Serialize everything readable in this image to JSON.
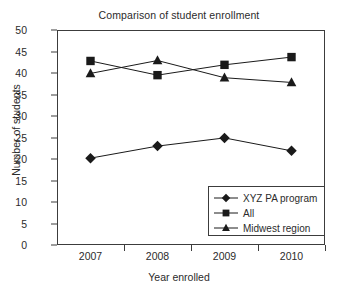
{
  "chart_data": {
    "type": "line",
    "title": "Comparison of student enrollment",
    "xlabel": "Year enrolled",
    "ylabel": "Number of students",
    "categories": [
      "2007",
      "2008",
      "2009",
      "2010"
    ],
    "ylim": [
      0,
      50
    ],
    "ytick_step": 5,
    "yticks": [
      "50",
      "45",
      "40",
      "35",
      "30",
      "25",
      "20",
      "15",
      "10",
      "5",
      "0"
    ],
    "grid": false,
    "legend_position": "inside-bottom-right",
    "series": [
      {
        "name": "XYZ PA program",
        "marker": "diamond",
        "color": "#1a1a1a",
        "values": [
          20.2,
          23.0,
          24.9,
          21.9
        ]
      },
      {
        "name": "All",
        "marker": "square",
        "color": "#1a1a1a",
        "values": [
          42.8,
          39.5,
          41.9,
          43.7
        ]
      },
      {
        "name": "Midwest region",
        "marker": "triangle",
        "color": "#1a1a1a",
        "values": [
          39.9,
          42.9,
          38.9,
          37.8
        ]
      }
    ]
  }
}
